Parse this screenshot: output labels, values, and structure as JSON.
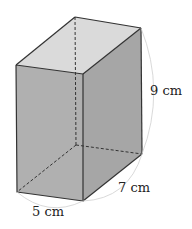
{
  "figure": {
    "type": "rectangular-prism",
    "labels": {
      "width": "5 cm",
      "depth": "7 cm",
      "height": "9 cm"
    },
    "colors": {
      "front_face": "#b0b0b0",
      "side_face": "#a6a6a6",
      "top_face": "#dadada",
      "edge": "#333333",
      "hidden_edge": "#333333",
      "arc": "#cfcfcf"
    }
  }
}
